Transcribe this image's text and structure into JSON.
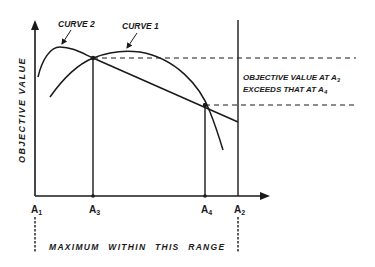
{
  "diagram": {
    "y_axis_label": "OBJECTIVE VALUE",
    "curve_labels": {
      "curve1": "CURVE 1",
      "curve2": "CURVE 2"
    },
    "x_points": [
      {
        "id": "a1",
        "label": "A",
        "sub": "1"
      },
      {
        "id": "a3",
        "label": "A",
        "sub": "3"
      },
      {
        "id": "a4",
        "label": "A",
        "sub": "4"
      },
      {
        "id": "a2",
        "label": "A",
        "sub": "2"
      }
    ],
    "annotation": {
      "line1_prefix": "OBJECTIVE VALUE AT A",
      "line1_sub": "3",
      "line2_prefix": "EXCEEDS THAT AT A",
      "line2_sub": "4"
    },
    "range_label": "MAXIMUM WITHIN THIS RANGE",
    "colors": {
      "ink": "#1a1a1a",
      "background": "#ffffff"
    }
  }
}
